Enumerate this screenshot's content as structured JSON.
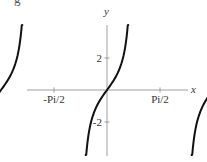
{
  "clipped_heading": "g",
  "chart_data": {
    "type": "line",
    "title": "",
    "xlabel": "x",
    "ylabel": "y",
    "function": "tan(x)",
    "x_ticks": [
      {
        "value": -4.712,
        "label": "-3Pi/2"
      },
      {
        "value": -1.571,
        "label": "-Pi/2"
      },
      {
        "value": 1.571,
        "label": "Pi/2"
      },
      {
        "value": 4.712,
        "label": "3Pi/2"
      }
    ],
    "y_ticks": [
      {
        "value": 2,
        "label": "2"
      },
      {
        "value": -2,
        "label": "-2"
      }
    ],
    "xlim": [
      -4.712,
      4.712
    ],
    "ylim": [
      -4,
      4
    ],
    "grid": false,
    "series": [
      {
        "name": "tan(x) branch centered at -Pi",
        "center": -3.1416,
        "color": "#111111"
      },
      {
        "name": "tan(x) branch centered at 0",
        "center": 0,
        "color": "#111111"
      },
      {
        "name": "tan(x) branch centered at Pi",
        "center": 3.1416,
        "color": "#111111"
      }
    ]
  }
}
